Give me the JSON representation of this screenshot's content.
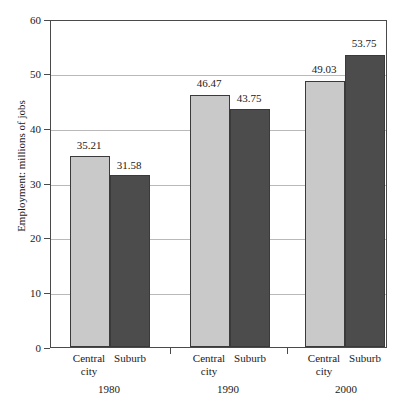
{
  "chart_data": {
    "type": "bar",
    "title": "",
    "subtitle": "",
    "xlabel": "",
    "ylabel": "Employment: millions of jobs",
    "ylim": [
      0,
      60
    ],
    "yticks": [
      0,
      10,
      20,
      30,
      40,
      50,
      60
    ],
    "ytick_labels": [
      "0",
      "10",
      "20",
      "30",
      "40",
      "50",
      "60"
    ],
    "grid": "horizontal",
    "legend": "none",
    "categories": [
      "1980",
      "1990",
      "2000"
    ],
    "series": [
      {
        "name": "Central city",
        "name_line1": "Central",
        "name_line2": "city",
        "color": "#c9c9c9",
        "values": [
          35.21,
          46.47,
          49.03
        ],
        "value_labels": [
          "35.21",
          "46.47",
          "49.03"
        ]
      },
      {
        "name": "Suburb",
        "name_line1": "Suburb",
        "name_line2": "",
        "color": "#4c4c4c",
        "values": [
          31.58,
          43.75,
          53.75
        ],
        "value_labels": [
          "31.58",
          "43.75",
          "53.75"
        ]
      }
    ],
    "groups": [
      {
        "year": "1980",
        "bars": [
          {
            "series": "Central city",
            "label_line1": "Central",
            "label_line2": "city",
            "value": 35.21,
            "value_label": "35.21",
            "style": "light"
          },
          {
            "series": "Suburb",
            "label_line1": "Suburb",
            "label_line2": "",
            "value": 31.58,
            "value_label": "31.58",
            "style": "dark"
          }
        ]
      },
      {
        "year": "1990",
        "bars": [
          {
            "series": "Central city",
            "label_line1": "Central",
            "label_line2": "city",
            "value": 46.47,
            "value_label": "46.47",
            "style": "light"
          },
          {
            "series": "Suburb",
            "label_line1": "Suburb",
            "label_line2": "",
            "value": 43.75,
            "value_label": "43.75",
            "style": "dark"
          }
        ]
      },
      {
        "year": "2000",
        "bars": [
          {
            "series": "Central city",
            "label_line1": "Central",
            "label_line2": "city",
            "value": 49.03,
            "value_label": "49.03",
            "style": "light"
          },
          {
            "series": "Suburb",
            "label_line1": "Suburb",
            "label_line2": "",
            "value": 53.75,
            "value_label": "53.75",
            "style": "dark"
          }
        ]
      }
    ],
    "colors": {
      "light_bar": "#c9c9c9",
      "dark_bar": "#4c4c4c",
      "gridline": "#b9b9b9",
      "axis": "#4a4a4a",
      "background": "#ffffff",
      "text": "#1a1a1a"
    }
  }
}
